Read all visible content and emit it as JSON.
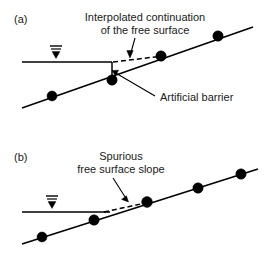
{
  "figure": {
    "background_color": "#ffffff",
    "line_color": "#000000",
    "text_color": "#1a1a1a"
  },
  "panels": [
    {
      "id": "panel-a",
      "label": "(a)",
      "annotations": [
        {
          "id": "interpolated-continuation",
          "line1": "Interpolated continuation",
          "line2": "of the free surface"
        },
        {
          "id": "artificial-barrier",
          "line1": "Artificial barrier",
          "line2": ""
        }
      ],
      "water_table_symbol": "water-table-triangle",
      "node_count": 4,
      "nodes": [
        {
          "x": 52,
          "y": 96
        },
        {
          "x": 112,
          "y": 78
        },
        {
          "x": 161,
          "y": 56
        },
        {
          "x": 218,
          "y": 36
        }
      ],
      "slope": {
        "x1": 22,
        "y1": 108,
        "x2": 253,
        "y2": 27
      },
      "free_surface": {
        "x1": 22,
        "y1": 62,
        "x2": 112,
        "y2": 62
      },
      "barrier": {
        "x1": 112,
        "y1": 62,
        "x2": 112,
        "y2": 79
      },
      "dashed": {
        "x1": 112,
        "y1": 62,
        "x2": 161,
        "y2": 56
      }
    },
    {
      "id": "panel-b",
      "label": "(b)",
      "annotations": [
        {
          "id": "spurious-free-surface-slope",
          "line1": "Spurious",
          "line2": "free surface slope"
        }
      ],
      "water_table_symbol": "water-table-triangle",
      "node_count": 4,
      "nodes": [
        {
          "x": 42,
          "y": 237
        },
        {
          "x": 94,
          "y": 220
        },
        {
          "x": 147,
          "y": 202
        },
        {
          "x": 198,
          "y": 188
        },
        {
          "x": 240,
          "y": 175
        }
      ],
      "slope": {
        "x1": 22,
        "y1": 244,
        "x2": 258,
        "y2": 169
      },
      "free_surface": {
        "x1": 22,
        "y1": 212,
        "x2": 112,
        "y2": 212
      },
      "dashed": {
        "x1": 108,
        "y1": 212,
        "x2": 147,
        "y2": 203
      }
    }
  ]
}
